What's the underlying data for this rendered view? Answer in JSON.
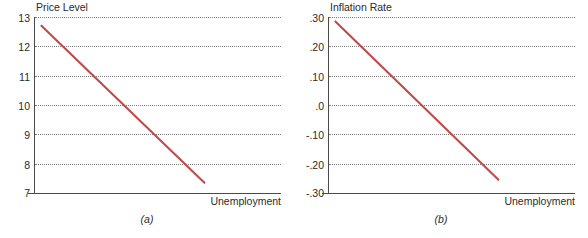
{
  "figure": {
    "accent_color": "#bf4b48",
    "axis_color": "#4a4a4a",
    "grid_color": "#7d7d7d"
  },
  "panels": [
    {
      "caption": "(a)",
      "ylabel": "Price Level",
      "xlabel": "Unemployment",
      "yticks": [
        "13",
        "12",
        "11",
        "10",
        "9",
        "8",
        "7"
      ]
    },
    {
      "caption": "(b)",
      "ylabel": "Inflation Rate",
      "xlabel": "Unemployment",
      "yticks": [
        ".30",
        ".20",
        ".10",
        ".0",
        "-.10",
        "-.20",
        "-.30"
      ]
    }
  ],
  "chart_data": [
    {
      "type": "line",
      "title": "Price Level",
      "xlabel": "Unemployment",
      "ylabel": "Price Level",
      "caption": "(a)",
      "grid": true,
      "legend": null,
      "ylim": [
        7,
        13
      ],
      "yticks": [
        13,
        12,
        11,
        10,
        9,
        8,
        7
      ],
      "ytick_labels": [
        "13",
        "12",
        "11",
        "10",
        "9",
        "8",
        "7"
      ],
      "xlim": [
        0,
        1
      ],
      "xticks": [],
      "series": [
        {
          "name": "price-level-curve",
          "color": "#bf4b48",
          "x": [
            0.03,
            0.69
          ],
          "y": [
            12.7,
            7.35
          ]
        }
      ]
    },
    {
      "type": "line",
      "title": "Inflation Rate",
      "xlabel": "Unemployment",
      "ylabel": "Inflation Rate",
      "caption": "(b)",
      "grid": true,
      "legend": null,
      "ylim": [
        -0.3,
        0.3
      ],
      "yticks": [
        0.3,
        0.2,
        0.1,
        0.0,
        -0.1,
        -0.2,
        -0.3
      ],
      "ytick_labels": [
        ".30",
        ".20",
        ".10",
        ".0",
        "-.10",
        "-.20",
        "-.30"
      ],
      "xlim": [
        0,
        1
      ],
      "xticks": [],
      "series": [
        {
          "name": "inflation-rate-curve",
          "color": "#bf4b48",
          "x": [
            0.03,
            0.69
          ],
          "y": [
            0.285,
            -0.255
          ]
        }
      ]
    }
  ]
}
